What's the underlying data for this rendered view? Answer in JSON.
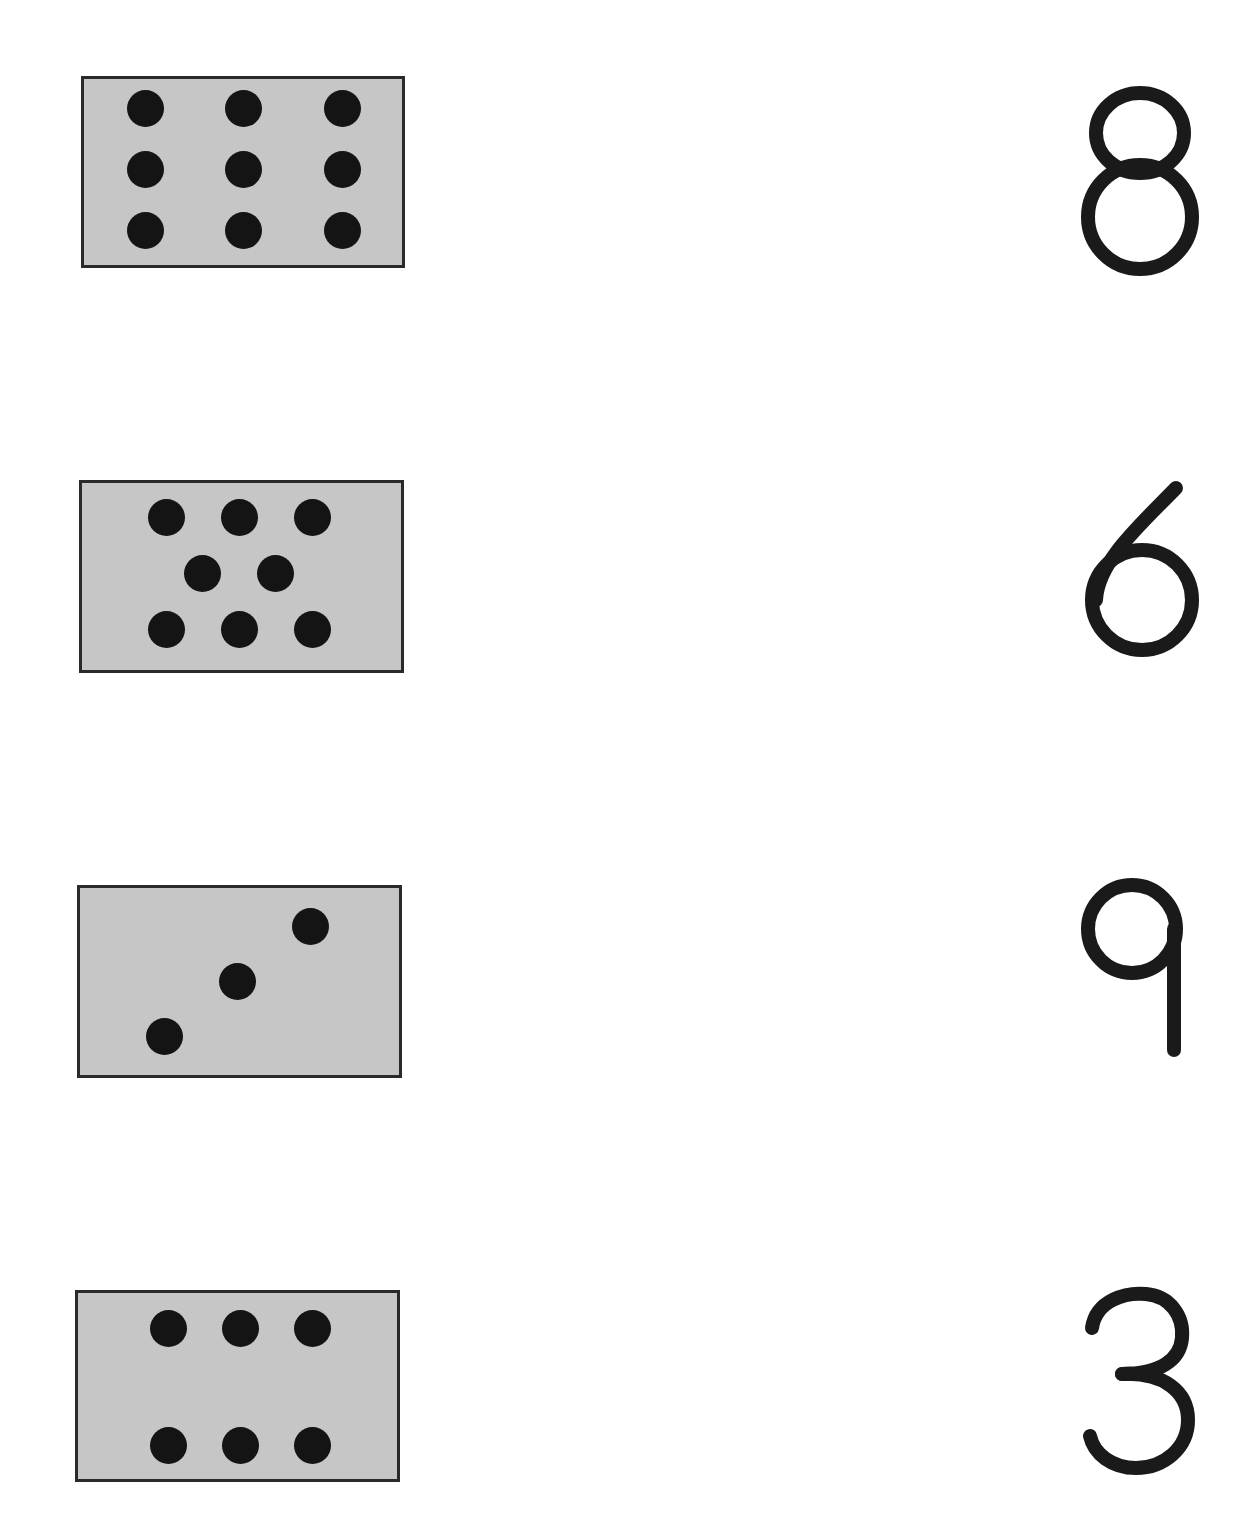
{
  "worksheet": {
    "rows": [
      {
        "card": {
          "dot_count": 9,
          "dots": [
            [
              145,
              108
            ],
            [
              243,
              108
            ],
            [
              342,
              108
            ],
            [
              145,
              169
            ],
            [
              243,
              169
            ],
            [
              342,
              169
            ],
            [
              145,
              230
            ],
            [
              243,
              230
            ],
            [
              342,
              230
            ]
          ]
        },
        "numeral": "8"
      },
      {
        "card": {
          "dot_count": 8,
          "dots": [
            [
              166,
              517
            ],
            [
              239,
              517
            ],
            [
              312,
              517
            ],
            [
              202,
              573
            ],
            [
              275,
              573
            ],
            [
              166,
              629
            ],
            [
              239,
              629
            ],
            [
              312,
              629
            ]
          ]
        },
        "numeral": "6"
      },
      {
        "card": {
          "dot_count": 3,
          "dots": [
            [
              310,
              926
            ],
            [
              237,
              981
            ],
            [
              164,
              1036
            ]
          ]
        },
        "numeral": "9"
      },
      {
        "card": {
          "dot_count": 6,
          "dots": [
            [
              168,
              1328
            ],
            [
              240,
              1328
            ],
            [
              312,
              1328
            ],
            [
              168,
              1445
            ],
            [
              240,
              1445
            ],
            [
              312,
              1445
            ]
          ]
        },
        "numeral": "3"
      }
    ],
    "colors": {
      "card_fill": "#c6c6c6",
      "card_border": "#2a2a2a",
      "dot": "#141414",
      "numeral": "#1a1a1a",
      "background": "#ffffff"
    }
  }
}
